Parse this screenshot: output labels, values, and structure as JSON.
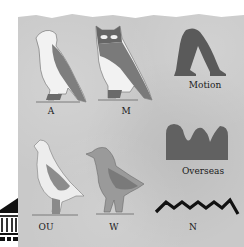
{
  "glyphs": [
    {
      "id": "falcon",
      "label": "A"
    },
    {
      "id": "owl",
      "label": "M"
    },
    {
      "id": "walking-legs",
      "label": "Motion"
    },
    {
      "id": "hill-country",
      "label": "Overseas"
    },
    {
      "id": "quail-chick",
      "label": "OU"
    },
    {
      "id": "swallow",
      "label": "W"
    },
    {
      "id": "water-zigzag",
      "label": "N"
    }
  ],
  "colors": {
    "panel": "#c9c9c9",
    "glyph_dark": "#5a5a5a",
    "glyph_mid": "#8a8a8a",
    "glyph_light": "#f2f2f2",
    "text": "#1a1a1a"
  },
  "side_icon": "museum-building-icon"
}
